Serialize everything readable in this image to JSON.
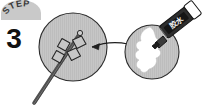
{
  "illustration": {
    "title": "Step 3 instructional diagram",
    "background_color": "#ffffff"
  },
  "step_badge": {
    "label": "STEP",
    "number": "3",
    "badge_fill": "#c9c9c9",
    "label_color": "#3a3a3a",
    "number_color": "#111111"
  },
  "left_panel": {
    "name": "leaf-specimen-circle",
    "circle_fill": "#c6c6c6",
    "circle_stroke": "#2b2b2b",
    "description": "Circle containing a plant stem with four diamond-shaped leaves",
    "leaf_count": "4"
  },
  "right_panel": {
    "name": "glue-application-circle",
    "circle_fill": "#c6c6c6",
    "circle_stroke": "#2b2b2b",
    "blob_fill": "#ffffff",
    "description": "Circle containing a white glue smear being applied by a marker pen"
  },
  "glue_pen": {
    "label": "胶水",
    "body_color": "#2e2e2e",
    "cap_color": "#ffffff",
    "label_color": "#f2f2f2"
  },
  "arrow": {
    "name": "transfer-arrow",
    "direction": "right-to-left",
    "color": "#1f1f1f"
  }
}
